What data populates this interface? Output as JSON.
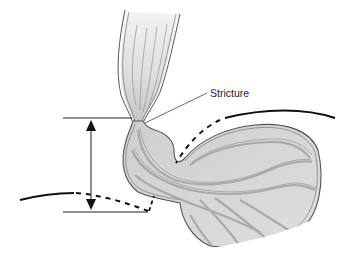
{
  "diagram": {
    "annotations": [
      {
        "id": "stricture",
        "text": "Stricture"
      }
    ],
    "structures": [
      "esophagus",
      "stricture",
      "hiatal-hernia-pouch",
      "stomach",
      "diaphragm-upper",
      "diaphragm-lower",
      "measurement-arrow"
    ],
    "colors": {
      "outline": "#555555",
      "fill_light": "#d9d9d9",
      "fill_mid": "#bdbdbd",
      "fill_fold": "#a8a8a8",
      "line": "#111111"
    }
  }
}
